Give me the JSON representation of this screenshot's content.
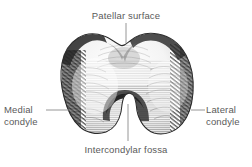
{
  "figure": {
    "background_color": "#ffffff",
    "ink_color": "#2b2b2b",
    "label_color": "#5a5a5a",
    "leader_color": "#7a7a7a"
  },
  "labels": {
    "patellar_surface": "Patellar surface",
    "medial_condyle": "Medial\ncondyle",
    "lateral_condyle": "Lateral\ncondyle",
    "intercondylar_fossa": "Intercondylar fossa"
  }
}
